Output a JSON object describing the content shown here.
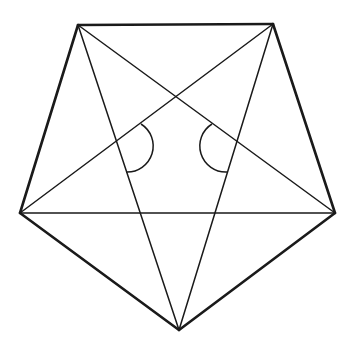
{
  "diagram": {
    "type": "geometry",
    "stroke_color": "#1a1a1a",
    "background": "#ffffff",
    "vertices": {
      "top_left": [
        78,
        25
      ],
      "top_right": [
        273,
        24
      ],
      "right": [
        335,
        213
      ],
      "bottom": [
        179,
        330
      ],
      "left": [
        20,
        213
      ]
    },
    "pentagon_edges": [
      [
        "top_left",
        "top_right"
      ],
      [
        "top_right",
        "right"
      ],
      [
        "right",
        "bottom"
      ],
      [
        "bottom",
        "left"
      ],
      [
        "left",
        "top_left"
      ]
    ],
    "diagonals": [
      [
        "top_left",
        "right"
      ],
      [
        "top_left",
        "bottom"
      ],
      [
        "top_right",
        "left"
      ],
      [
        "top_right",
        "bottom"
      ],
      [
        "left",
        "right"
      ]
    ],
    "angle_arcs": [
      {
        "name": "left-angle-arc",
        "path": "M 141 124 A 26 26 0 0 1 126 172"
      },
      {
        "name": "right-angle-arc",
        "path": "M 212 124 A 26 26 0 0 0 227 172"
      }
    ]
  }
}
